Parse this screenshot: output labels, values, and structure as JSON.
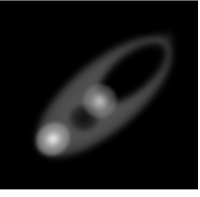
{
  "image": {
    "description": "Grayscale rendering of a tilted elliptical ring/disk on a black background",
    "background_color": "#000000",
    "frame_color": "#ffffff",
    "features": [
      {
        "name": "elliptical-disk",
        "center": [
          104,
          96
        ],
        "tilt_deg": -40,
        "color": "#5f5f5f"
      },
      {
        "name": "inner-hole",
        "center": [
          132,
          72
        ],
        "color": "#000000"
      },
      {
        "name": "central-bright-blob",
        "center": [
          100,
          100
        ],
        "color": "#cdcdcd"
      },
      {
        "name": "dark-spot",
        "center": [
          84,
          117
        ],
        "color": "#000000"
      },
      {
        "name": "bright-spot",
        "center": [
          53,
          138
        ],
        "color": "#f5f5f5"
      }
    ]
  }
}
